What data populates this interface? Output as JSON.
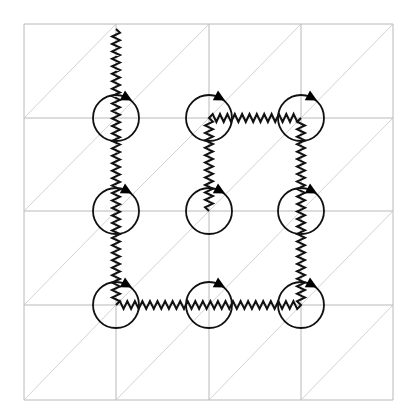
{
  "diagram": {
    "grid": {
      "x_lines": [
        24,
        116,
        209,
        301,
        393
      ],
      "y_lines": [
        24,
        118,
        211,
        305,
        400
      ],
      "diagonals": "bottom-left to top-right in every cell"
    },
    "vortices": [
      {
        "id": "v-r1-c1",
        "cx": 116,
        "cy": 118,
        "r": 23,
        "orientation": "clockwise"
      },
      {
        "id": "v-r1-c2",
        "cx": 209,
        "cy": 118,
        "r": 23,
        "orientation": "clockwise"
      },
      {
        "id": "v-r1-c3",
        "cx": 301,
        "cy": 118,
        "r": 23,
        "orientation": "clockwise"
      },
      {
        "id": "v-r2-c1",
        "cx": 116,
        "cy": 211,
        "r": 23,
        "orientation": "clockwise"
      },
      {
        "id": "v-r2-c2",
        "cx": 209,
        "cy": 211,
        "r": 23,
        "orientation": "clockwise"
      },
      {
        "id": "v-r2-c3",
        "cx": 301,
        "cy": 211,
        "r": 23,
        "orientation": "clockwise"
      },
      {
        "id": "v-r3-c1",
        "cx": 116,
        "cy": 305,
        "r": 23,
        "orientation": "clockwise"
      },
      {
        "id": "v-r3-c2",
        "cx": 209,
        "cy": 305,
        "r": 23,
        "orientation": "clockwise"
      },
      {
        "id": "v-r3-c3",
        "cx": 301,
        "cy": 305,
        "r": 23,
        "orientation": "clockwise"
      }
    ],
    "strings": [
      {
        "id": "string-outer",
        "points": [
          [
            116,
            29
          ],
          [
            116,
            305
          ],
          [
            301,
            305
          ],
          [
            301,
            118
          ],
          [
            209,
            118
          ],
          [
            209,
            211
          ]
        ]
      }
    ],
    "colors": {
      "grid": "#b8b8b8",
      "diagonal": "#c8c8c8",
      "ink": "#111111",
      "background": "#ffffff"
    }
  }
}
